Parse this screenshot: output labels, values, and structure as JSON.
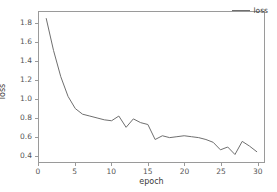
{
  "chart_data": {
    "type": "line",
    "title": "",
    "xlabel": "epoch",
    "ylabel": "loss",
    "xlim": [
      0,
      31
    ],
    "ylim": [
      0.33,
      1.93
    ],
    "xticks": [
      0,
      5,
      10,
      15,
      20,
      25,
      30
    ],
    "xtick_labels": [
      "0",
      "5",
      "10",
      "15",
      "20",
      "25",
      "30"
    ],
    "yticks": [
      0.4,
      0.6,
      0.8,
      1.0,
      1.2,
      1.4,
      1.6,
      1.8
    ],
    "ytick_labels": [
      "0.4",
      "0.6",
      "0.8",
      "1.0",
      "1.2",
      "1.4",
      "1.6",
      "1.8"
    ],
    "grid": false,
    "legend_position": "upper right",
    "legend_frame": false,
    "line_color": "#6f6f6f",
    "axis_color": "#9a9a9a",
    "background_color": "#ffffff",
    "series": [
      {
        "name": "loss",
        "x": [
          1,
          2,
          3,
          4,
          5,
          6,
          7,
          8,
          9,
          10,
          11,
          12,
          13,
          14,
          15,
          16,
          17,
          18,
          19,
          20,
          21,
          22,
          23,
          24,
          25,
          26,
          27,
          28,
          29,
          30
        ],
        "values": [
          1.86,
          1.52,
          1.24,
          1.03,
          0.9,
          0.84,
          0.82,
          0.8,
          0.78,
          0.77,
          0.82,
          0.7,
          0.79,
          0.75,
          0.73,
          0.57,
          0.61,
          0.59,
          0.6,
          0.61,
          0.6,
          0.59,
          0.57,
          0.54,
          0.46,
          0.49,
          0.41,
          0.55,
          0.5,
          0.44
        ]
      }
    ]
  },
  "legend": {
    "entries": [
      {
        "label": "loss",
        "color": "#6f6f6f",
        "marker": "line-sample"
      }
    ]
  },
  "axes": {
    "x_title": "epoch",
    "y_title": "loss"
  }
}
